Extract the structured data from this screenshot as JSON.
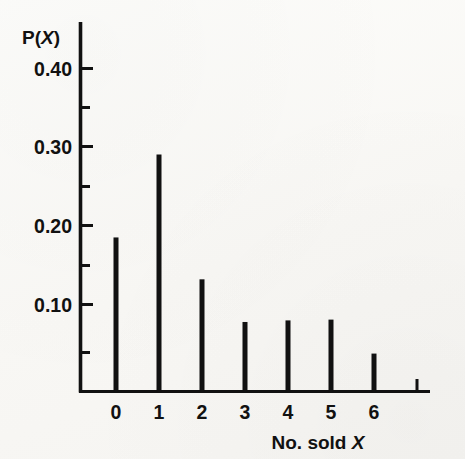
{
  "figure": {
    "kind": "probability-distribution-spike-plot",
    "background_color": "#fbfaf8",
    "ink_color": "#111111"
  },
  "labels": {
    "y_axis_title_main": "P(",
    "y_axis_title_var": "X",
    "y_axis_title_close": ")",
    "y_axis_title_full": "P(X)",
    "x_axis_title_main": "No. sold ",
    "x_axis_title_var": "X",
    "x_axis_title_full": "No. sold X"
  },
  "chart_data": {
    "type": "bar",
    "title": "",
    "subtitle": "",
    "xlabel": "No. sold X",
    "ylabel": "P(X)",
    "categories": [
      "0",
      "1",
      "2",
      "3",
      "4",
      "5",
      "6"
    ],
    "values": [
      0.195,
      0.3,
      0.142,
      0.088,
      0.09,
      0.091,
      0.048
    ],
    "xlim": [
      -0.85,
      7.15
    ],
    "ylim": [
      0,
      0.45
    ],
    "ytick_values": [
      0.05,
      0.1,
      0.15,
      0.2,
      0.25,
      0.3,
      0.35,
      0.4
    ],
    "ytick_labels": [
      "",
      "0.10",
      "",
      "0.20",
      "",
      "0.30",
      "",
      "0.40"
    ],
    "ytick_major": [
      0.1,
      0.2,
      0.3,
      0.4
    ],
    "ytick_minor": [
      0.05,
      0.15,
      0.25,
      0.35
    ],
    "xtick_values": [
      0,
      1,
      2,
      3,
      4,
      5,
      6
    ],
    "xtick_labels": [
      "0",
      "1",
      "2",
      "3",
      "4",
      "5",
      "6"
    ],
    "grid": false,
    "legend": false,
    "legend_position": "none",
    "bar_style": "spike",
    "bar_color": "#111111",
    "annotations": []
  },
  "geometry": {
    "axis_x_px": 80,
    "axis_top_px": 22,
    "baseline_y_px": 392,
    "axis_right_px": 430,
    "x0_px": 116,
    "x_step_px": 43,
    "px_per_0_10": 79,
    "spike_width_px": 5,
    "tick_len_major_px": 13,
    "tick_len_minor_px": 9
  }
}
